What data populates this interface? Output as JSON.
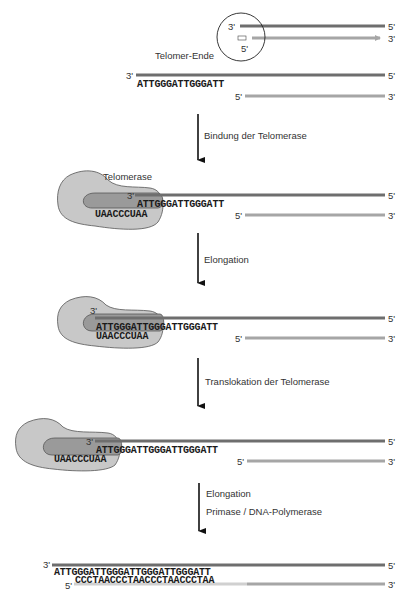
{
  "colors": {
    "dark_strand": "#6e6e6e",
    "light_strand": "#a6a6a6",
    "telomerase_fill": "#c8c8c8",
    "rna_template_fill": "#9a9a9a",
    "outline": "#444444",
    "arrow": "#111111"
  },
  "overview": {
    "label": "Telomer-Ende",
    "top_left": "3'",
    "top_right": "5'",
    "bottom_left": "5'",
    "bottom_right": "3'"
  },
  "stages": [
    {
      "id": "initial",
      "top_left": "3'",
      "top_right": "5'",
      "bottom_left": "5'",
      "bottom_right": "3'",
      "dna_sequence": "ATTGGGATTGGGATT"
    },
    {
      "id": "binding",
      "enzyme_label": "Telomerase",
      "top_left": "3'",
      "top_right": "5'",
      "bottom_left": "5'",
      "bottom_right": "3'",
      "dna_sequence": "ATTGGGATTGGGATT",
      "rna_template": "UAACCCUAA"
    },
    {
      "id": "elongation",
      "top_left": "3'",
      "top_right": "5'",
      "bottom_left": "5'",
      "bottom_right": "3'",
      "dna_sequence": "ATTGGGATTGGGATTGGGATT",
      "rna_template": "UAACCCUAA"
    },
    {
      "id": "translocation",
      "top_left": "3'",
      "top_right": "5'",
      "bottom_left": "5'",
      "bottom_right": "3'",
      "dna_sequence": "ATTGGGATTGGGATTGGGATT",
      "rna_template": "UAACCCUAA"
    },
    {
      "id": "final",
      "top_left": "3'",
      "top_right": "5'",
      "bottom_left": "5'",
      "bottom_right": "3'",
      "dna_sequence": "ATTGGGATTGGGATTGGGATTGGGATT",
      "complement_sequence": "CCCTAACCCTAACCCTAACCCTAA"
    }
  ],
  "steps": [
    {
      "label": "Bindung der Telomerase"
    },
    {
      "label": "Elongation"
    },
    {
      "label": "Translokation der Telomerase"
    },
    {
      "label": "Elongation",
      "sublabel": "Primase / DNA-Polymerase"
    }
  ]
}
